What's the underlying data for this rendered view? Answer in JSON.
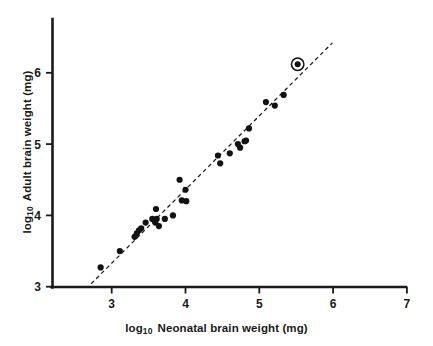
{
  "chart_data": {
    "type": "scatter",
    "title": "",
    "xlabel": "log10 Neonatal brain weight (mg)",
    "ylabel": "log10 Adult brain weight (mg)",
    "xlabel_prefix": "log",
    "xlabel_subscript": "10",
    "xlabel_rest": "Neonatal brain weight (mg)",
    "ylabel_prefix": "log",
    "ylabel_subscript": "10",
    "ylabel_rest": "Adult brain weight (mg)",
    "xlim": [
      2.5,
      7.0
    ],
    "ylim": [
      3.0,
      6.45
    ],
    "xticks": [
      3,
      4,
      5,
      6,
      7
    ],
    "xtick_labels": [
      "3",
      "4",
      "5",
      "6",
      "7"
    ],
    "yticks": [
      3,
      4,
      5,
      6
    ],
    "ytick_labels": [
      "3",
      "4",
      "5",
      "6"
    ],
    "grid": false,
    "legend": "none",
    "marker_color": "#121212",
    "line_color": "#1a1a1a",
    "axis_color": "#1a1a1a",
    "background": "#ffffff",
    "series": [
      {
        "name": "species",
        "marker": "filled-circle",
        "points": [
          [
            2.85,
            3.27
          ],
          [
            3.11,
            3.5
          ],
          [
            3.31,
            3.7
          ],
          [
            3.34,
            3.75
          ],
          [
            3.37,
            3.79
          ],
          [
            3.4,
            3.82
          ],
          [
            3.46,
            3.9
          ],
          [
            3.6,
            4.09
          ],
          [
            3.55,
            3.95
          ],
          [
            3.61,
            3.95
          ],
          [
            3.59,
            3.9
          ],
          [
            3.64,
            3.85
          ],
          [
            3.72,
            3.95
          ],
          [
            3.83,
            4.0
          ],
          [
            3.95,
            4.21
          ],
          [
            4.0,
            4.36
          ],
          [
            3.92,
            4.5
          ],
          [
            4.01,
            4.2
          ],
          [
            4.44,
            4.84
          ],
          [
            4.47,
            4.73
          ],
          [
            4.6,
            4.87
          ],
          [
            4.71,
            5.0
          ],
          [
            4.74,
            4.95
          ],
          [
            4.8,
            5.04
          ],
          [
            4.82,
            5.05
          ],
          [
            4.86,
            5.22
          ],
          [
            5.09,
            5.59
          ],
          [
            5.21,
            5.54
          ],
          [
            5.33,
            5.69
          ]
        ]
      },
      {
        "name": "highlighted-species",
        "marker": "circled-filled-circle",
        "points": [
          [
            5.52,
            6.12
          ]
        ]
      }
    ],
    "fit_line": {
      "style": "dashed",
      "x": [
        2.72,
        5.99
      ],
      "y": [
        3.04,
        6.42
      ]
    }
  }
}
